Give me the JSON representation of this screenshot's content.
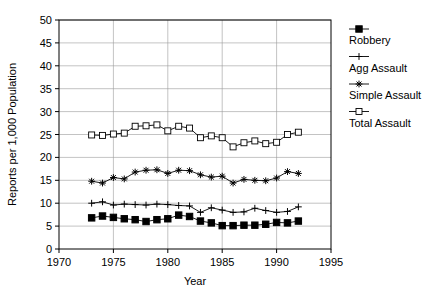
{
  "chart_data": {
    "type": "line",
    "title": "",
    "xlabel": "Year",
    "ylabel": "Reports per 1,000 Population",
    "xlim": [
      1970,
      1995
    ],
    "ylim": [
      0,
      50
    ],
    "xticks": [
      1970,
      1975,
      1980,
      1985,
      1990,
      1995
    ],
    "yticks": [
      0,
      5,
      10,
      15,
      20,
      25,
      30,
      35,
      40,
      45,
      50
    ],
    "grid": true,
    "legend_position": "right",
    "x": [
      1973,
      1974,
      1975,
      1976,
      1977,
      1978,
      1979,
      1980,
      1981,
      1982,
      1983,
      1984,
      1985,
      1986,
      1987,
      1988,
      1989,
      1990,
      1991,
      1992
    ],
    "series": [
      {
        "name": "Robbery",
        "marker": "filled-square",
        "color": "#000000",
        "values": [
          6.8,
          7.2,
          6.9,
          6.6,
          6.4,
          6.0,
          6.4,
          6.6,
          7.4,
          7.1,
          6.1,
          5.7,
          5.1,
          5.1,
          5.2,
          5.2,
          5.4,
          5.8,
          5.7,
          6.1
        ]
      },
      {
        "name": "Agg Assault",
        "marker": "plus",
        "color": "#000000",
        "values": [
          10.0,
          10.3,
          9.6,
          9.8,
          9.7,
          9.6,
          9.8,
          9.7,
          9.5,
          9.4,
          8.0,
          9.0,
          8.5,
          8.0,
          8.1,
          8.9,
          8.4,
          8.0,
          8.2,
          9.2
        ]
      },
      {
        "name": "Simple Assault",
        "marker": "asterisk",
        "color": "#000000",
        "values": [
          14.8,
          14.4,
          15.6,
          15.3,
          16.8,
          17.2,
          17.3,
          16.5,
          17.2,
          17.1,
          16.2,
          15.7,
          15.9,
          14.4,
          15.2,
          15.0,
          14.9,
          15.5,
          16.9,
          16.5
        ]
      },
      {
        "name": "Total Assault",
        "marker": "open-square",
        "color": "#000000",
        "values": [
          24.9,
          24.8,
          25.1,
          25.3,
          26.8,
          26.9,
          27.1,
          25.8,
          26.8,
          26.4,
          24.3,
          24.7,
          24.3,
          22.3,
          23.2,
          23.6,
          23.0,
          23.3,
          25.0,
          25.5
        ]
      }
    ]
  },
  "axes": {
    "y_title": "Reports per 1,000 Population",
    "x_title": "Year",
    "y_tick_labels": [
      "0",
      "5",
      "10",
      "15",
      "20",
      "25",
      "30",
      "35",
      "40",
      "45",
      "50"
    ],
    "x_tick_labels": [
      "1970",
      "1975",
      "1980",
      "1985",
      "1990",
      "1995"
    ]
  },
  "legend": {
    "entries": [
      {
        "label": "Robbery",
        "marker": "filled-square"
      },
      {
        "label": "Agg Assault",
        "marker": "plus"
      },
      {
        "label": "Simple Assault",
        "marker": "asterisk"
      },
      {
        "label": "Total Assault",
        "marker": "open-square"
      }
    ]
  }
}
